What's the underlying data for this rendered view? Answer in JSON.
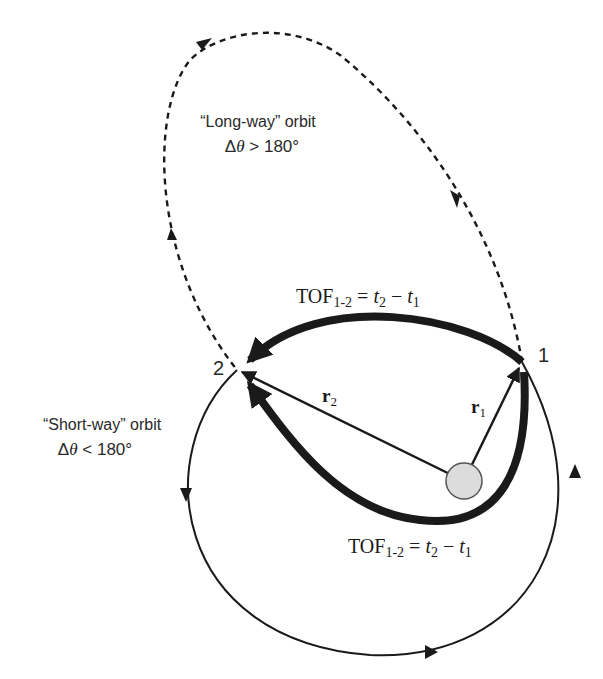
{
  "labels": {
    "long_way_line1": "“Long-way” orbit",
    "long_way_line2_delta": "Δ",
    "long_way_line2_theta": "θ",
    "long_way_line2_rest": " > 180°",
    "short_way_line1": "“Short-way” orbit",
    "short_way_line2_delta": "Δ",
    "short_way_line2_theta": "θ",
    "short_way_line2_rest": " < 180°",
    "point_1": "1",
    "point_2": "2",
    "r1_main": "r",
    "r1_sub": "1",
    "r2_main": "r",
    "r2_sub": "2",
    "tof_top": {
      "prefix": "TOF",
      "sub": "1-2",
      "eq": " = ",
      "t2": "t",
      "t2_sub": "2",
      "minus": " − ",
      "t1": "t",
      "t1_sub": "1"
    },
    "tof_bottom": {
      "prefix": "TOF",
      "sub": "1-2",
      "eq": " = ",
      "t2": "t",
      "t2_sub": "2",
      "minus": " − ",
      "t1": "t",
      "t1_sub": "1"
    }
  },
  "colors": {
    "line": "#1a1a1a",
    "central_body_fill": "#dcdcdc",
    "central_body_stroke": "#555555",
    "background": "#ffffff"
  },
  "elements": {
    "point_1": {
      "x": 522,
      "y": 362
    },
    "point_2": {
      "x": 237,
      "y": 370
    },
    "central_body": {
      "x": 464,
      "y": 481,
      "r": 18
    }
  }
}
